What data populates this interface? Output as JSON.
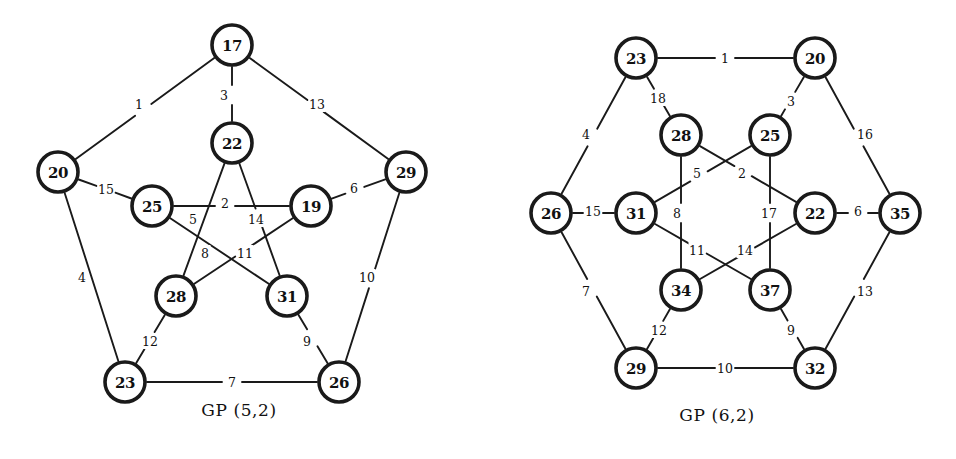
{
  "figure": {
    "background_color": "#ffffff",
    "ink_color": "#1a1a1a"
  },
  "panels": [
    {
      "id": "gp52",
      "caption": "GP (5,2)",
      "node_count": 10,
      "edge_count": 15,
      "nodes": [
        {
          "label": "17",
          "x": 232,
          "y": 45,
          "r": 22,
          "ring": "outer"
        },
        {
          "label": "20",
          "x": 58,
          "y": 172,
          "r": 22,
          "ring": "outer"
        },
        {
          "label": "29",
          "x": 406,
          "y": 172,
          "r": 22,
          "ring": "outer"
        },
        {
          "label": "23",
          "x": 125,
          "y": 382,
          "r": 22,
          "ring": "outer"
        },
        {
          "label": "26",
          "x": 339,
          "y": 382,
          "r": 22,
          "ring": "outer"
        },
        {
          "label": "22",
          "x": 232,
          "y": 143,
          "r": 22,
          "ring": "inner"
        },
        {
          "label": "25",
          "x": 152,
          "y": 206,
          "r": 22,
          "ring": "inner"
        },
        {
          "label": "19",
          "x": 311,
          "y": 206,
          "r": 22,
          "ring": "inner"
        },
        {
          "label": "28",
          "x": 176,
          "y": 296,
          "r": 22,
          "ring": "inner"
        },
        {
          "label": "31",
          "x": 287,
          "y": 296,
          "r": 22,
          "ring": "inner"
        }
      ],
      "edges": [
        {
          "label": "1",
          "from": "17",
          "to": "20",
          "lx": 139,
          "ly": 104
        },
        {
          "label": "3",
          "from": "17",
          "to": "22",
          "lx": 224,
          "ly": 95
        },
        {
          "label": "13",
          "from": "17",
          "to": "29",
          "lx": 317,
          "ly": 104
        },
        {
          "label": "15",
          "from": "20",
          "to": "25",
          "lx": 106,
          "ly": 189
        },
        {
          "label": "4",
          "from": "20",
          "to": "23",
          "lx": 82,
          "ly": 277
        },
        {
          "label": "6",
          "from": "29",
          "to": "19",
          "lx": 354,
          "ly": 188
        },
        {
          "label": "10",
          "from": "29",
          "to": "26",
          "lx": 367,
          "ly": 277
        },
        {
          "label": "12",
          "from": "23",
          "to": "28",
          "lx": 150,
          "ly": 341
        },
        {
          "label": "7",
          "from": "23",
          "to": "26",
          "lx": 232,
          "ly": 382
        },
        {
          "label": "9",
          "from": "26",
          "to": "31",
          "lx": 307,
          "ly": 341
        },
        {
          "label": "2",
          "from": "25",
          "to": "19",
          "lx": 225,
          "ly": 203
        },
        {
          "label": "5",
          "from": "22",
          "to": "28",
          "lx": 193,
          "ly": 219
        },
        {
          "label": "14",
          "from": "22",
          "to": "31",
          "lx": 256,
          "ly": 219
        },
        {
          "label": "8",
          "from": "25",
          "to": "31",
          "lx": 205,
          "ly": 253
        },
        {
          "label": "11",
          "from": "19",
          "to": "28",
          "lx": 245,
          "ly": 253
        }
      ]
    },
    {
      "id": "gp62",
      "caption": "GP (6,2)",
      "node_count": 12,
      "edge_count": 18,
      "nodes": [
        {
          "label": "23",
          "x": 158,
          "y": 58,
          "r": 22,
          "ring": "outer"
        },
        {
          "label": "20",
          "x": 337,
          "y": 58,
          "r": 22,
          "ring": "outer"
        },
        {
          "label": "26",
          "x": 73,
          "y": 213,
          "r": 22,
          "ring": "outer"
        },
        {
          "label": "35",
          "x": 422,
          "y": 213,
          "r": 22,
          "ring": "outer"
        },
        {
          "label": "29",
          "x": 158,
          "y": 368,
          "r": 22,
          "ring": "outer"
        },
        {
          "label": "32",
          "x": 337,
          "y": 368,
          "r": 22,
          "ring": "outer"
        },
        {
          "label": "28",
          "x": 203,
          "y": 135,
          "r": 22,
          "ring": "inner"
        },
        {
          "label": "25",
          "x": 292,
          "y": 135,
          "r": 22,
          "ring": "inner"
        },
        {
          "label": "31",
          "x": 158,
          "y": 213,
          "r": 22,
          "ring": "inner"
        },
        {
          "label": "22",
          "x": 337,
          "y": 213,
          "r": 22,
          "ring": "inner"
        },
        {
          "label": "34",
          "x": 203,
          "y": 290,
          "r": 22,
          "ring": "inner"
        },
        {
          "label": "37",
          "x": 292,
          "y": 290,
          "r": 22,
          "ring": "inner"
        }
      ],
      "edges": [
        {
          "label": "1",
          "from": "23",
          "to": "20",
          "lx": 247,
          "ly": 58
        },
        {
          "label": "18",
          "from": "23",
          "to": "28",
          "lx": 180,
          "ly": 98
        },
        {
          "label": "4",
          "from": "23",
          "to": "26",
          "lx": 108,
          "ly": 134
        },
        {
          "label": "3",
          "from": "20",
          "to": "25",
          "lx": 313,
          "ly": 101
        },
        {
          "label": "16",
          "from": "20",
          "to": "35",
          "lx": 387,
          "ly": 134
        },
        {
          "label": "15",
          "from": "26",
          "to": "31",
          "lx": 115,
          "ly": 211
        },
        {
          "label": "7",
          "from": "26",
          "to": "29",
          "lx": 108,
          "ly": 291
        },
        {
          "label": "6",
          "from": "22",
          "to": "35",
          "lx": 380,
          "ly": 211
        },
        {
          "label": "13",
          "from": "35",
          "to": "32",
          "lx": 387,
          "ly": 291
        },
        {
          "label": "12",
          "from": "29",
          "to": "34",
          "lx": 181,
          "ly": 330
        },
        {
          "label": "10",
          "from": "29",
          "to": "32",
          "lx": 247,
          "ly": 368
        },
        {
          "label": "9",
          "from": "32",
          "to": "37",
          "lx": 313,
          "ly": 330
        },
        {
          "label": "5",
          "from": "25",
          "to": "31",
          "lx": 219,
          "ly": 173
        },
        {
          "label": "2",
          "from": "28",
          "to": "22",
          "lx": 264,
          "ly": 173
        },
        {
          "label": "8",
          "from": "28",
          "to": "34",
          "lx": 199,
          "ly": 213
        },
        {
          "label": "17",
          "from": "25",
          "to": "37",
          "lx": 291,
          "ly": 213
        },
        {
          "label": "11",
          "from": "31",
          "to": "37",
          "lx": 219,
          "ly": 250
        },
        {
          "label": "14",
          "from": "22",
          "to": "34",
          "lx": 267,
          "ly": 250
        }
      ]
    }
  ]
}
